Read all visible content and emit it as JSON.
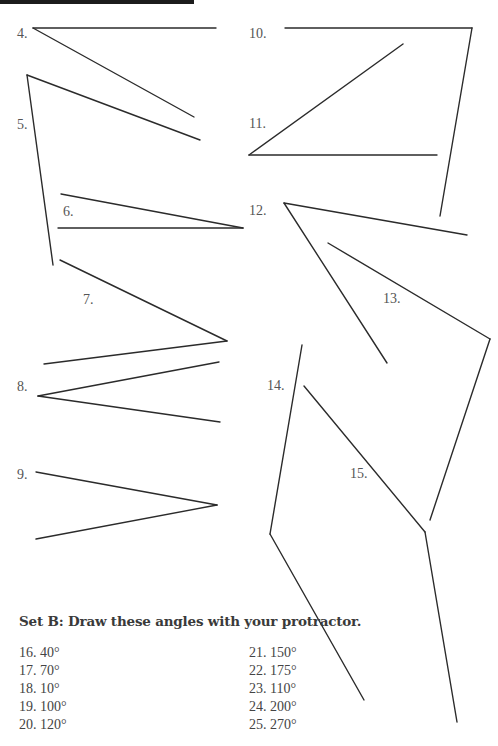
{
  "set_a": {
    "problems": [
      {
        "number": "4.",
        "label_pos": [
          17,
          27
        ],
        "vertex": [
          33,
          28
        ],
        "arms": [
          [
            216,
            28
          ],
          [
            194,
            117
          ]
        ]
      },
      {
        "number": "5.",
        "label_pos": [
          17,
          118
        ],
        "vertex": [
          27,
          75
        ],
        "arms": [
          [
            53,
            265
          ],
          [
            200,
            140
          ]
        ]
      },
      {
        "number": "6.",
        "label_pos": [
          63,
          205
        ],
        "vertex": [
          243,
          228
        ],
        "arms": [
          [
            61,
            194
          ],
          [
            58,
            228
          ]
        ]
      },
      {
        "number": "7.",
        "label_pos": [
          83,
          293
        ],
        "vertex": [
          227,
          341
        ],
        "arms": [
          [
            60,
            260
          ],
          [
            44,
            364
          ]
        ]
      },
      {
        "number": "8.",
        "label_pos": [
          17,
          380
        ],
        "vertex": [
          38,
          396
        ],
        "arms": [
          [
            219,
            362
          ],
          [
            220,
            422
          ]
        ]
      },
      {
        "number": "9.",
        "label_pos": [
          17,
          468
        ],
        "vertex": [
          217,
          505
        ],
        "arms": [
          [
            36,
            472
          ],
          [
            36,
            539
          ]
        ]
      },
      {
        "number": "10.",
        "label_pos": [
          249,
          27
        ],
        "vertex": [
          472,
          28
        ],
        "arms": [
          [
            285,
            28
          ],
          [
            440,
            216
          ]
        ]
      },
      {
        "number": "11.",
        "label_pos": [
          249,
          117
        ],
        "vertex": [
          249,
          155
        ],
        "arms": [
          [
            403,
            44
          ],
          [
            437,
            155
          ]
        ]
      },
      {
        "number": "12.",
        "label_pos": [
          249,
          204
        ],
        "vertex": [
          284,
          203
        ],
        "arms": [
          [
            467,
            235
          ],
          [
            387,
            363
          ]
        ]
      },
      {
        "number": "13.",
        "label_pos": [
          383,
          292
        ],
        "vertex": [
          490,
          339
        ],
        "arms": [
          [
            328,
            243
          ],
          [
            430,
            520
          ]
        ]
      },
      {
        "number": "14.",
        "label_pos": [
          267,
          379
        ],
        "vertex": [
          270,
          534
        ],
        "arms": [
          [
            302,
            345
          ],
          [
            364,
            700
          ]
        ]
      },
      {
        "number": "15.",
        "label_pos": [
          350,
          467
        ],
        "vertex": [
          425,
          532
        ],
        "arms": [
          [
            304,
            386
          ],
          [
            457,
            722
          ]
        ]
      }
    ]
  },
  "set_b": {
    "heading": "Set B: Draw these angles with your protractor.",
    "left_column": [
      "16. 40°",
      "17. 70°",
      "18. 10°",
      "19. 100°",
      "20. 120°"
    ],
    "right_column": [
      "21. 150°",
      "22. 175°",
      "23. 110°",
      "24. 200°",
      "25. 270°"
    ]
  }
}
